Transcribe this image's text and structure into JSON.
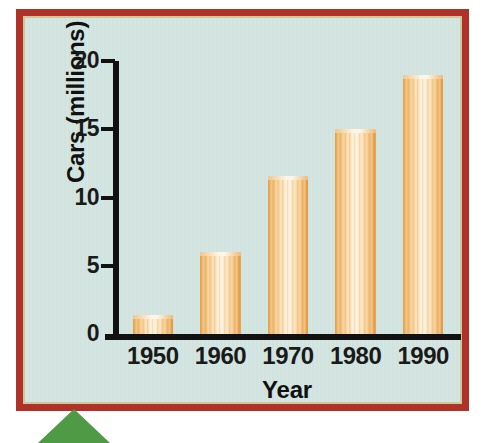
{
  "figure": {
    "border_color": "#b03128",
    "inner_edge_color": "#cfc79a",
    "background_color": "#d3e5e0",
    "bar_color": "#f0bc72",
    "bar_highlight_color": "#fdf3e0",
    "bar_edge_color": "#e09a3e",
    "axis_color": "#111111",
    "arrow_color": "#4e9a45",
    "arrow_icon_name": "green-triangle-pointer"
  },
  "chart_data": {
    "type": "bar",
    "title": "",
    "xlabel": "Year",
    "ylabel": "Cars (millions)",
    "categories": [
      "1950",
      "1960",
      "1970",
      "1980",
      "1990"
    ],
    "values": [
      1.4,
      6.0,
      11.6,
      15.0,
      19.0
    ],
    "ylim": [
      0,
      20
    ],
    "yticks": [
      0,
      5,
      10,
      15,
      20
    ],
    "ytick_labels": [
      "0",
      "5",
      "10",
      "15",
      "20"
    ],
    "grid": false,
    "legend": null,
    "series": [
      {
        "name": "Cars (millions)",
        "values": [
          1.4,
          6.0,
          11.6,
          15.0,
          19.0
        ]
      }
    ]
  }
}
